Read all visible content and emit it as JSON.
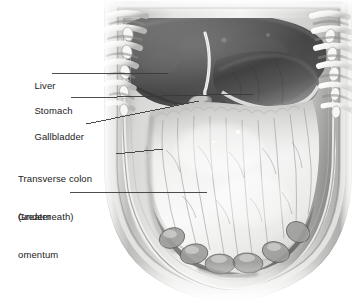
{
  "figure": {
    "width": 359,
    "height": 301,
    "background_color": "#ffffff",
    "style": "grayscale medical illustration",
    "leader_line_color": "#3a3a3a",
    "label_text_color": "#1b1b1b"
  },
  "labels": [
    {
      "id": "liver",
      "line1": "Liver",
      "line2": "",
      "text_x": 18,
      "text_y": 67,
      "leader": {
        "x1": 52,
        "y1": 73,
        "x2": 168,
        "y2": 73
      }
    },
    {
      "id": "stomach",
      "line1": "Stomach",
      "line2": "",
      "text_x": 18,
      "text_y": 92,
      "leader": {
        "x1": 71,
        "y1": 98,
        "x2": 253,
        "y2": 94
      }
    },
    {
      "id": "gallbladder",
      "line1": "Gallbladder",
      "line2": "",
      "text_x": 18,
      "text_y": 118,
      "leader": {
        "x1": 86,
        "y1": 124,
        "x2": 199,
        "y2": 101
      }
    },
    {
      "id": "transverse-colon",
      "line1": "Transverse colon",
      "line2": "(underneath)",
      "text_x": 18,
      "text_y": 148,
      "leader": {
        "x1": 116,
        "y1": 154,
        "x2": 163,
        "y2": 149
      }
    },
    {
      "id": "greater-omentum",
      "line1": "Greater",
      "line2": "omentum",
      "text_x": 18,
      "text_y": 186,
      "leader": {
        "x1": 70,
        "y1": 192,
        "x2": 207,
        "y2": 192
      }
    }
  ],
  "anatomy": {
    "structures": [
      "rib cage",
      "liver",
      "falciform ligament",
      "stomach",
      "gallbladder",
      "transverse colon",
      "greater omentum",
      "small intestine",
      "abdominal wall"
    ]
  },
  "colors": {
    "liver_dark": "#4a4a4a",
    "liver_mid": "#5f5f5f",
    "stomach_dark": "#3c3c3c",
    "omentum_light": "#f2f2f0",
    "omentum_shadow": "#b9b9b7",
    "wall_gray": "#9a9a98",
    "rib_light": "#e8e8e6",
    "intestine_gray": "#8d8d8b"
  }
}
